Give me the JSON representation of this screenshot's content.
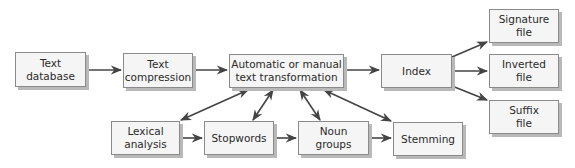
{
  "diagram": {
    "colors": {
      "box_fill": "#f5f5f5",
      "box_border": "#8a8a8a",
      "box_shadow": "#b9b9b9",
      "arrow": "#444444",
      "text": "#2a2a2a"
    },
    "nodes": {
      "text_database": {
        "label": "Text\ndatabase"
      },
      "text_compression": {
        "label": "Text\ncompression"
      },
      "text_transformation": {
        "label": "Automatic or manual\ntext transformation"
      },
      "index": {
        "label": "Index"
      },
      "signature_file": {
        "label": "Signature\nfile"
      },
      "inverted_file": {
        "label": "Inverted\nfile"
      },
      "suffix_file": {
        "label": "Suffix\nfile"
      },
      "lexical_analysis": {
        "label": "Lexical\nanalysis"
      },
      "stopwords": {
        "label": "Stopwords"
      },
      "noun_groups": {
        "label": "Noun\ngroups"
      },
      "stemming": {
        "label": "Stemming"
      }
    },
    "edges": [
      {
        "from": "text_database",
        "to": "text_compression",
        "type": "directed"
      },
      {
        "from": "text_compression",
        "to": "text_transformation",
        "type": "directed"
      },
      {
        "from": "text_transformation",
        "to": "index",
        "type": "directed"
      },
      {
        "from": "index",
        "to": "signature_file",
        "type": "directed"
      },
      {
        "from": "index",
        "to": "inverted_file",
        "type": "directed"
      },
      {
        "from": "index",
        "to": "suffix_file",
        "type": "directed"
      },
      {
        "from": "lexical_analysis",
        "to": "stopwords",
        "type": "directed"
      },
      {
        "from": "stopwords",
        "to": "noun_groups",
        "type": "directed"
      },
      {
        "from": "noun_groups",
        "to": "stemming",
        "type": "directed"
      },
      {
        "from": "text_transformation",
        "to": "lexical_analysis",
        "type": "bidirectional"
      },
      {
        "from": "text_transformation",
        "to": "stopwords",
        "type": "bidirectional"
      },
      {
        "from": "text_transformation",
        "to": "noun_groups",
        "type": "bidirectional"
      },
      {
        "from": "text_transformation",
        "to": "stemming",
        "type": "bidirectional"
      }
    ]
  }
}
